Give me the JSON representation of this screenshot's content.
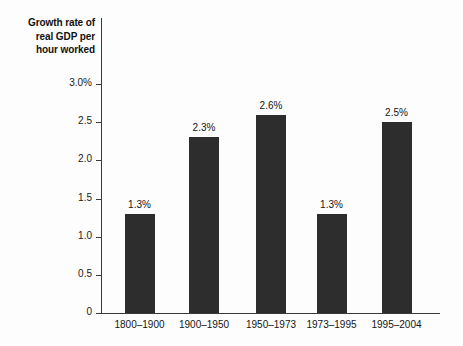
{
  "chart_data": {
    "type": "bar",
    "title": "Growth rate of real GDP per hour worked",
    "title_lines": [
      "Growth rate of",
      "real GDP per",
      "hour worked"
    ],
    "xlabel": "",
    "ylabel": "Growth rate of real GDP per hour worked",
    "categories": [
      "1800–1900",
      "1900–1950",
      "1950–1973",
      "1973–1995",
      "1995–2004"
    ],
    "values": [
      1.3,
      2.3,
      2.6,
      1.3,
      2.5
    ],
    "data_labels": [
      "1.3%",
      "2.3%",
      "2.6%",
      "1.3%",
      "2.5%"
    ],
    "ylim": [
      0,
      3.0
    ],
    "ytick_values": [
      3.0,
      2.5,
      2.0,
      1.5,
      1.0,
      0.5,
      0
    ],
    "ytick_labels": [
      "3.0%",
      "2.5",
      "2.0",
      "1.5",
      "1.0",
      "0.5",
      "0"
    ],
    "grid": false,
    "legend": null,
    "bar_color": "#2d2d2d",
    "axis_color": "#3a3a3a",
    "background_color": "#fdfdfd",
    "text_color": "#141414"
  }
}
